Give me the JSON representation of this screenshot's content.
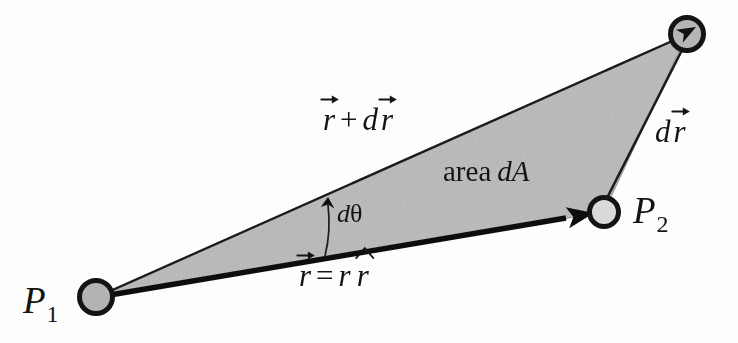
{
  "figure": {
    "name": "differential-area-swept-by-radius-vector",
    "background_color": "#fdfdfd",
    "shade_color": "#b9b9b9",
    "line_color": "#161616",
    "width": 738,
    "height": 343
  },
  "labels": {
    "p1": {
      "base": "P",
      "sub": "1"
    },
    "p2": {
      "base": "P",
      "sub": "2"
    },
    "r_plus_dr": {
      "v1": "r",
      "operator": "+",
      "d": "d",
      "v2": "r",
      "plain_text": "r⃗ + d r⃗"
    },
    "dr": {
      "d": "d",
      "v": "r",
      "plain_text": "d r⃗"
    },
    "area": {
      "word": "area",
      "symbol": "dA",
      "plain_text": "area dA"
    },
    "d_theta": {
      "d": "d",
      "theta": "θ",
      "plain_text": "dθ"
    },
    "r_equals_r_rhat": {
      "v": "r",
      "equals": "=",
      "scalar": "r",
      "unit": "r",
      "plain_text": "r⃗ = r r̂"
    }
  },
  "geometry": {
    "vertices": {
      "p1": {
        "x": 96,
        "y": 297,
        "label": "P1"
      },
      "p2": {
        "x": 604,
        "y": 212,
        "label": "P2"
      },
      "p3": {
        "x": 687,
        "y": 34,
        "label": "tip of r + dr"
      }
    },
    "nodes": [
      {
        "name": "p1-node",
        "cx": 96,
        "cy": 297,
        "r": 17,
        "fill": "#b5b5b5",
        "stroke": "#161616",
        "stroke_width": 5
      },
      {
        "name": "p2-node",
        "cx": 604,
        "cy": 212,
        "r": 15,
        "fill": "#d6d6d6",
        "stroke": "#161616",
        "stroke_width": 5
      },
      {
        "name": "p3-node",
        "cx": 687,
        "cy": 34,
        "r": 17,
        "fill": "#b5b5b5",
        "stroke": "#161616",
        "stroke_width": 5
      }
    ],
    "edges": [
      {
        "name": "vector-r",
        "from": "p1",
        "to": "p2",
        "style": "thick-arrow",
        "width": 5
      },
      {
        "name": "vector-r-plus-dr",
        "from": "p1",
        "to": "p3",
        "style": "thin-arrow",
        "width": 2
      },
      {
        "name": "vector-dr",
        "from": "p2",
        "to": "p3",
        "style": "thin",
        "width": 2
      }
    ],
    "shaded_region": {
      "name": "area-dA",
      "points": "96,297 687,34 604,212"
    },
    "angle_marker": {
      "name": "d-theta-arc",
      "description": "small arc with arrowhead between vector r and vector r+dr"
    }
  }
}
